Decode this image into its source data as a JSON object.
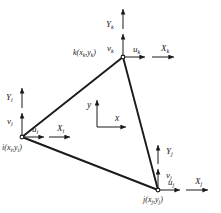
{
  "figure": {
    "type": "triangular-finite-element-diagram",
    "background_color": "#ffffff",
    "line_color": "#1a1a1a",
    "text_color": "#1a1a1a",
    "width": 221,
    "height": 213
  },
  "nodes": {
    "i": {
      "label": "i(x",
      "label_sub1": "i",
      "label_mid": ",y",
      "label_sub2": "i",
      "label_end": ")",
      "x": 22,
      "y": 137
    },
    "j": {
      "label": "j(x",
      "label_sub1": "j",
      "label_mid": ",y",
      "label_sub2": "j",
      "label_end": ")",
      "x": 158,
      "y": 190
    },
    "k": {
      "label": "k(x",
      "label_sub1": "k",
      "label_mid": ",y",
      "label_sub2": "k",
      "label_end": ")",
      "x": 123,
      "y": 57
    }
  },
  "local_axes": {
    "i": {
      "X": "X",
      "X_sub": "i",
      "Y": "Y",
      "Y_sub": "i",
      "u": "u",
      "u_sub": "i",
      "v": "v",
      "v_sub": "i"
    },
    "j": {
      "X": "X",
      "X_sub": "j",
      "Y": "Y",
      "Y_sub": "j",
      "u": "u",
      "u_sub": "j",
      "v": "v",
      "v_sub": "j"
    },
    "k": {
      "X": "X",
      "X_sub": "k",
      "Y": "Y",
      "Y_sub": "k",
      "u": "u",
      "u_sub": "k",
      "v": "v",
      "v_sub": "k"
    }
  },
  "global_axes": {
    "x_label": "x",
    "y_label": "y",
    "origin_x": 97,
    "origin_y": 127
  }
}
